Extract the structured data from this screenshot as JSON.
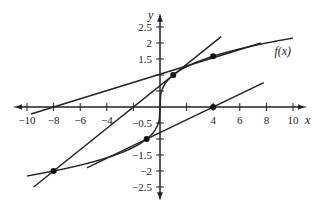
{
  "chart_data": {
    "type": "line",
    "title": "",
    "xlabel": "x",
    "ylabel": "y",
    "xlim": [
      -11,
      11
    ],
    "ylim": [
      -2.9,
      2.9
    ],
    "grid": false,
    "x_ticks": [
      -10,
      -8,
      -6,
      -4,
      -2,
      2,
      4,
      6,
      8,
      10
    ],
    "x_tick_labels": [
      "−10",
      "−8",
      "−6",
      "−4",
      "",
      "",
      "4",
      "6",
      "8",
      "10"
    ],
    "y_ticks": [
      -2.5,
      -2,
      -1.5,
      -1,
      -0.5,
      0.5,
      1,
      1.5,
      2,
      2.5
    ],
    "y_tick_labels": [
      "−2.5",
      "−2",
      "−1.5",
      "",
      "−0.5",
      "",
      "",
      "1.5",
      "2",
      "2.5"
    ],
    "series": [
      {
        "name": "f(x)",
        "function": "cube root of x",
        "x_range": [
          -10,
          10
        ]
      },
      {
        "name": "line through (-8,-2) and (1,1)",
        "points": [
          [
            -9.5,
            -2.5
          ],
          [
            4.6,
            2.2
          ]
        ]
      },
      {
        "name": "line through (-8,0) and (4,1.59)",
        "points": [
          [
            -9.7,
            -0.22
          ],
          [
            7.6,
            2.0
          ]
        ]
      },
      {
        "name": "line through (-1,-1) and (4,0)",
        "points": [
          [
            -5.5,
            -1.9
          ],
          [
            7.8,
            0.76
          ]
        ]
      }
    ],
    "marked_points": [
      [
        -8,
        -2
      ],
      [
        -1,
        -1
      ],
      [
        1,
        1
      ],
      [
        4,
        1.587
      ],
      [
        4,
        0
      ]
    ],
    "annotations": [
      {
        "text": "f(x)",
        "x": 8.6,
        "y": 1.75
      }
    ]
  }
}
